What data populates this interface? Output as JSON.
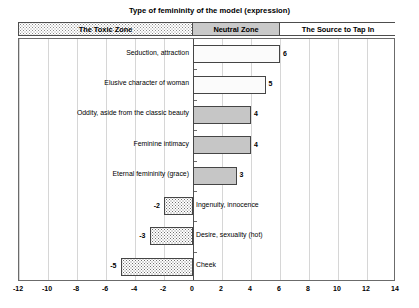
{
  "chart_data": {
    "type": "bar",
    "orientation": "horizontal",
    "title": "Type of femininity of the model (expression)",
    "xlabel": "",
    "ylabel": "",
    "xlim": [
      -12,
      14
    ],
    "xticks": [
      -12,
      -10,
      -8,
      -6,
      -4,
      -2,
      0,
      2,
      4,
      6,
      8,
      10,
      12,
      14
    ],
    "grid": true,
    "legend": "none",
    "categories": [
      "Seduction, attraction",
      "Elusive character of woman",
      "Oddity, aside from the classic beauty",
      "Feminine intimacy",
      "Eternal femininity (grace)",
      "Ingenuity, innocence",
      "Desire, sexuality (hot)",
      "Cheek"
    ],
    "values": [
      6,
      5,
      4,
      4,
      3,
      -2,
      -3,
      -5
    ],
    "bar_styles": [
      "white",
      "white",
      "grey",
      "grey",
      "grey",
      "dots",
      "dots",
      "dots"
    ],
    "data_labels": [
      "6",
      "5",
      "4",
      "4",
      "3",
      "-2",
      "-3",
      "-5"
    ],
    "zones": [
      {
        "label": "The Toxic Zone",
        "range": [
          -12,
          0
        ],
        "style": "dots"
      },
      {
        "label": "Neutral Zone",
        "range": [
          0,
          6
        ],
        "style": "grey"
      },
      {
        "label": "The Source to Tap In",
        "range": [
          6,
          14
        ],
        "style": "white"
      }
    ]
  },
  "axis": {
    "tick_labels": [
      "-12",
      "-10",
      "-8",
      "-6",
      "-4",
      "-2",
      "0",
      "2",
      "4",
      "6",
      "8",
      "10",
      "12",
      "14"
    ]
  }
}
